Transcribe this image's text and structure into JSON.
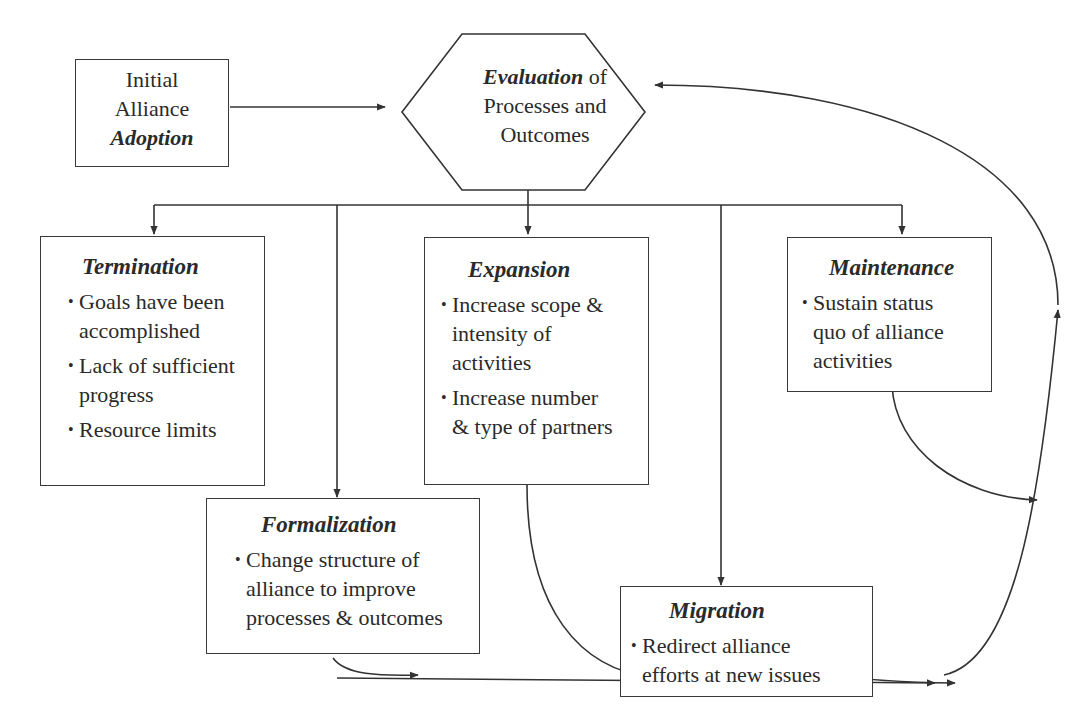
{
  "adoption": {
    "line1": "Initial",
    "line2": "Alliance",
    "line3": "Adoption"
  },
  "evaluation": {
    "emph": "Evaluation",
    "rest1": " of",
    "line2": "Processes and",
    "line3": "Outcomes"
  },
  "outcomes": {
    "termination": {
      "title": "Termination",
      "items": [
        [
          "Goals have been",
          "accomplished"
        ],
        [
          "Lack of sufficient",
          "progress"
        ],
        [
          "Resource limits"
        ]
      ]
    },
    "expansion": {
      "title": "Expansion",
      "items": [
        [
          "Increase scope &",
          "intensity of",
          "activities"
        ],
        [
          "Increase number",
          "& type of partners"
        ]
      ]
    },
    "maintenance": {
      "title": "Maintenance",
      "items": [
        [
          "Sustain status",
          "quo of alliance",
          "activities"
        ]
      ]
    },
    "formalization": {
      "title": "Formalization",
      "items": [
        [
          "Change structure of",
          "alliance to improve",
          "processes & outcomes"
        ]
      ]
    },
    "migration": {
      "title": "Migration",
      "items": [
        [
          "Redirect alliance",
          "efforts at new issues"
        ]
      ]
    }
  },
  "bullet_glyph": "•",
  "colors": {
    "stroke": "#333333",
    "text": "#2a2a2a",
    "background": "#ffffff"
  }
}
